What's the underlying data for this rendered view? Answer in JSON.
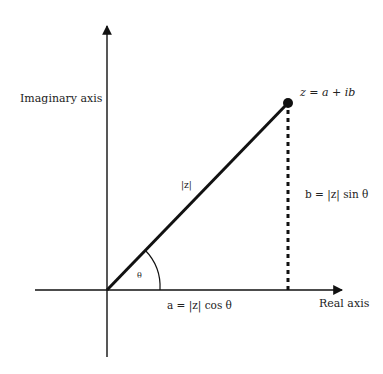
{
  "diagram": {
    "type": "complex-plane-polar-form",
    "axes": {
      "real_label": "Real axis",
      "imaginary_label": "Imaginary axis"
    },
    "point": {
      "label": "z = a + ib"
    },
    "vector": {
      "label": "|z|"
    },
    "angle": {
      "label": "θ"
    },
    "projections": {
      "horizontal_label": "a =  |z| cos θ",
      "vertical_label": "b = |z| sin θ"
    },
    "colors": {
      "line": "#111111",
      "text": "#222222",
      "background": "#ffffff"
    }
  }
}
